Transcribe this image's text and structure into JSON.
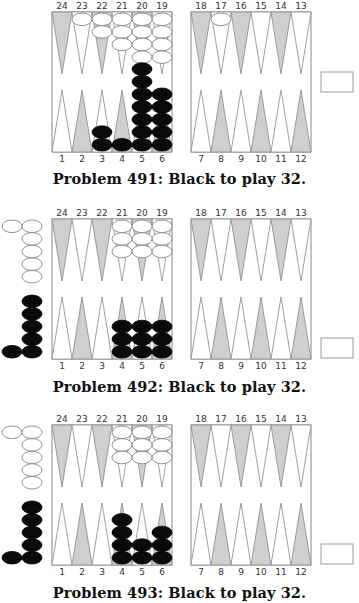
{
  "colors": {
    "shaded_point": "#cfcfcf",
    "light_point": "#ffffff",
    "line": "#888888",
    "black_checker": "#0a0a0a",
    "white_checker": "#ffffff"
  },
  "top_point_labels": [
    "24",
    "23",
    "22",
    "21",
    "20",
    "19",
    "18",
    "17",
    "16",
    "15",
    "14",
    "13"
  ],
  "bottom_point_labels": [
    "1",
    "2",
    "3",
    "4",
    "5",
    "6",
    "7",
    "8",
    "9",
    "10",
    "11",
    "12"
  ],
  "problems": [
    {
      "caption": "Problem 491:  Black to play 32.",
      "white_points": {
        "23": 1,
        "22": 2,
        "21": 3,
        "20": 4,
        "19": 4,
        "17": 1
      },
      "black_points": {
        "3": 2,
        "4": 1,
        "5": 7,
        "6": 5
      },
      "white_off": 0,
      "black_off": 0,
      "cube_position": "middle"
    },
    {
      "caption": "Problem 492:  Black to play 32.",
      "white_points": {
        "21": 3,
        "20": 3,
        "19": 3
      },
      "black_points": {
        "4": 3,
        "5": 3,
        "6": 3
      },
      "white_off": 6,
      "black_off": 6,
      "cube_position": "bottom"
    },
    {
      "caption": "Problem 493:  Black to play 32.",
      "white_points": {
        "21": 3,
        "20": 3,
        "19": 3
      },
      "black_points": {
        "4": 4,
        "5": 2,
        "6": 3
      },
      "white_off": 6,
      "black_off": 6,
      "cube_position": "bottom"
    }
  ]
}
